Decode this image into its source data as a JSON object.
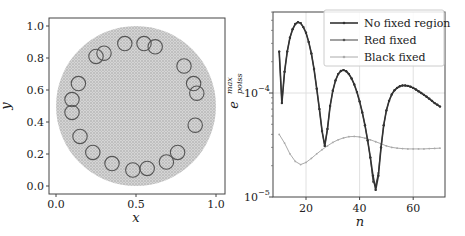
{
  "chart_data": [
    {
      "type": "scatter",
      "panel": "left",
      "xlabel": "x",
      "ylabel": "y",
      "xlim": [
        -0.05,
        1.05
      ],
      "ylim": [
        -0.05,
        1.05
      ],
      "x_ticks": [
        "0.0",
        "0.5",
        "1.0"
      ],
      "y_ticks": [
        "0.0",
        "0.2",
        "0.4",
        "0.6",
        "0.8",
        "1.0"
      ],
      "grid": false,
      "description": "Dense point cloud filling unit-diameter disk centred at (0.5,0.5) with 22 small open circles arranged near the boundary",
      "disk": {
        "cx": 0.5,
        "cy": 0.5,
        "r": 0.5,
        "color": "#bdbdbd"
      },
      "circles": {
        "radius": 0.045,
        "color": "#555555",
        "centers": [
          [
            0.25,
            0.81
          ],
          [
            0.3,
            0.83
          ],
          [
            0.43,
            0.89
          ],
          [
            0.55,
            0.89
          ],
          [
            0.62,
            0.87
          ],
          [
            0.8,
            0.75
          ],
          [
            0.86,
            0.64
          ],
          [
            0.88,
            0.58
          ],
          [
            0.87,
            0.38
          ],
          [
            0.76,
            0.21
          ],
          [
            0.69,
            0.15
          ],
          [
            0.57,
            0.11
          ],
          [
            0.48,
            0.1
          ],
          [
            0.35,
            0.14
          ],
          [
            0.23,
            0.21
          ],
          [
            0.15,
            0.31
          ],
          [
            0.1,
            0.46
          ],
          [
            0.1,
            0.54
          ],
          [
            0.14,
            0.64
          ]
        ]
      }
    },
    {
      "type": "line",
      "panel": "right",
      "xlabel": "n",
      "ylabel": "e_poiss^max",
      "ylabel_main": "e",
      "ylabel_sub": "poiss",
      "ylabel_sup": "max",
      "yscale": "log",
      "xlim": [
        7,
        72
      ],
      "ylim": [
        1e-05,
        0.0006
      ],
      "x_ticks": [
        "20",
        "40",
        "60"
      ],
      "y_ticks": [
        {
          "base": "10",
          "exp": "−4"
        },
        {
          "base": "10",
          "exp": "−5"
        }
      ],
      "grid": true,
      "legend_position": "upper right",
      "series": [
        {
          "name": "No fixed region",
          "color": "#333333",
          "x": [
            10,
            11,
            12,
            13,
            14,
            15,
            16,
            17,
            18,
            19,
            20,
            21,
            22,
            23,
            24,
            25,
            26,
            27,
            28,
            29,
            30,
            31,
            32,
            33,
            34,
            35,
            36,
            37,
            38,
            39,
            40,
            41,
            42,
            43,
            44,
            45,
            46,
            47,
            48,
            49,
            50,
            51,
            52,
            53,
            54,
            55,
            56,
            57,
            58,
            59,
            60,
            61,
            62,
            63,
            64,
            65,
            66,
            67,
            68,
            69,
            70
          ],
          "values": [
            0.00025,
            8e-05,
            0.00016,
            0.00025,
            0.00034,
            0.00041,
            0.00046,
            0.00048,
            0.00047,
            0.00043,
            0.00038,
            0.00031,
            0.00024,
            0.00017,
            0.00011,
            7e-05,
            4.3e-05,
            3.1e-05,
            4.5e-05,
            7.5e-05,
            0.000105,
            0.000132,
            0.000152,
            0.000163,
            0.000166,
            0.000162,
            0.000152,
            0.000138,
            0.000121,
            0.000102,
            8.3e-05,
            6.5e-05,
            4.9e-05,
            3.5e-05,
            2.4e-05,
            1.6e-05,
            1.17e-05,
            1.6e-05,
            3e-05,
            4.9e-05,
            6.8e-05,
            8.4e-05,
            9.7e-05,
            0.000106,
            0.000112,
            0.000116,
            0.000118,
            0.000118,
            0.000117,
            0.000115,
            0.000112,
            0.000108,
            0.000104,
            0.0001,
            9.6e-05,
            9.2e-05,
            8.8e-05,
            8.4e-05,
            8e-05,
            7.7e-05,
            7.4e-05
          ]
        },
        {
          "name": "Red fixed",
          "color": "#555555",
          "x": [
            10,
            11,
            12,
            13,
            14,
            15,
            16,
            17,
            18,
            19,
            20,
            21,
            22,
            23,
            24,
            25,
            26,
            27,
            28,
            29,
            30,
            31,
            32,
            33,
            34,
            35,
            36,
            37,
            38,
            39,
            40,
            41,
            42,
            43,
            44,
            45,
            46,
            47,
            48,
            49,
            50,
            51,
            52,
            53,
            54,
            55,
            56,
            57,
            58,
            59,
            60,
            61,
            62,
            63,
            64,
            65,
            66,
            67,
            68,
            69,
            70
          ],
          "values": [
            0.00025,
            8e-05,
            0.00016,
            0.00025,
            0.00034,
            0.00041,
            0.00046,
            0.00048,
            0.00047,
            0.00043,
            0.00038,
            0.00031,
            0.00024,
            0.00017,
            0.00011,
            7e-05,
            4.3e-05,
            3.1e-05,
            4.5e-05,
            7.5e-05,
            0.000105,
            0.000132,
            0.000152,
            0.000163,
            0.000166,
            0.000162,
            0.000152,
            0.000138,
            0.000121,
            0.000102,
            8.3e-05,
            6.5e-05,
            4.9e-05,
            3.5e-05,
            2.4e-05,
            1.4e-05,
            1.3e-05,
            1.7e-05,
            3e-05,
            4.9e-05,
            6.8e-05,
            8.4e-05,
            9.7e-05,
            0.000106,
            0.000112,
            0.000116,
            0.000118,
            0.000118,
            0.000117,
            0.000115,
            0.000112,
            0.000108,
            0.000104,
            0.0001,
            9.6e-05,
            9.2e-05,
            8.8e-05,
            8.4e-05,
            8e-05,
            7.7e-05,
            7.4e-05
          ]
        },
        {
          "name": "Black fixed",
          "color": "#aaaaaa",
          "x": [
            10,
            12,
            14,
            16,
            18,
            20,
            22,
            24,
            26,
            28,
            30,
            32,
            34,
            36,
            38,
            40,
            42,
            44,
            46,
            48,
            50,
            52,
            54,
            56,
            58,
            60,
            62,
            64,
            66,
            68,
            70
          ],
          "values": [
            4e-05,
            3.3e-05,
            2.6e-05,
            2.2e-05,
            2.05e-05,
            2.15e-05,
            2.35e-05,
            2.6e-05,
            2.85e-05,
            3.1e-05,
            3.35e-05,
            3.55e-05,
            3.7e-05,
            3.8e-05,
            3.82e-05,
            3.78e-05,
            3.68e-05,
            3.55e-05,
            3.4e-05,
            3.25e-05,
            3.1e-05,
            3e-05,
            2.95e-05,
            2.92e-05,
            2.9e-05,
            2.9e-05,
            2.9e-05,
            2.9e-05,
            2.92e-05,
            2.93e-05,
            2.95e-05
          ]
        }
      ]
    }
  ]
}
